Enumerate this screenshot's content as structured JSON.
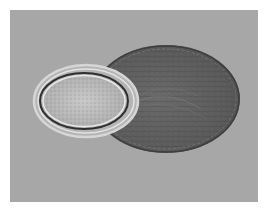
{
  "image": {
    "subject": "microscopy image of an egg with a dark attached sac",
    "colors": {
      "background": "#a7a7a7",
      "page": "#ffffff",
      "dark_sac": "#5e5e5e",
      "egg_shell": "#c4c4c4",
      "egg_inner": "#b8b8b8"
    }
  }
}
